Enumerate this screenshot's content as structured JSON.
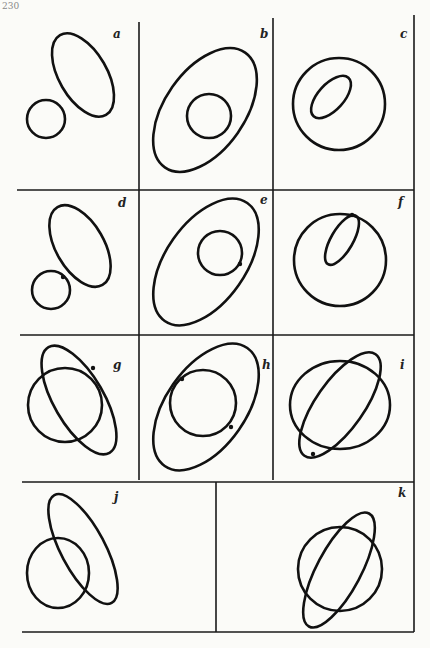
{
  "page": {
    "number": "230"
  },
  "figure": {
    "panels": [
      {
        "id": "a",
        "label": "a",
        "description": "ellipse and circle separate"
      },
      {
        "id": "b",
        "label": "b",
        "description": "circle inside ellipse"
      },
      {
        "id": "c",
        "label": "c",
        "description": "ellipse inside circle"
      },
      {
        "id": "d",
        "label": "d",
        "description": "ellipse and circle externally tangent"
      },
      {
        "id": "e",
        "label": "e",
        "description": "circle internally tangent to ellipse"
      },
      {
        "id": "f",
        "label": "f",
        "description": "ellipse internally tangent to circle"
      },
      {
        "id": "g",
        "label": "g",
        "description": "ellipse and circle intersect, one tangency"
      },
      {
        "id": "h",
        "label": "h",
        "description": "circle inside ellipse with two tangencies"
      },
      {
        "id": "i",
        "label": "i",
        "description": "ellipse inside circle with two tangencies"
      },
      {
        "id": "j",
        "label": "j",
        "description": "ellipse and circle intersect at two points"
      },
      {
        "id": "k",
        "label": "k",
        "description": "ellipse and circle intersect at four points"
      }
    ]
  }
}
